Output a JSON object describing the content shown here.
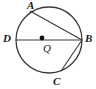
{
  "figure": {
    "type": "circle-with-inscribed-chords",
    "stroke_color": "#3a3a3a",
    "background_color": "#ffffff",
    "label_color": "#1a1a1a"
  },
  "circle": {
    "center_x": 49,
    "center_y": 40,
    "radius": 33,
    "stroke_width": 1.3
  },
  "center_point": {
    "label": "Q",
    "x": 42,
    "y": 38,
    "dot_radius": 2.4
  },
  "points": [
    {
      "name": "A",
      "label": "A",
      "x": 30,
      "y": 11,
      "label_x": 27,
      "label_y": 0
    },
    {
      "name": "B",
      "label": "B",
      "x": 82,
      "y": 40,
      "label_x": 85,
      "label_y": 33
    },
    {
      "name": "C",
      "label": "C",
      "x": 61,
      "y": 71,
      "label_x": 53,
      "label_y": 76
    },
    {
      "name": "D",
      "label": "D",
      "x": 16,
      "y": 40,
      "label_x": 3,
      "label_y": 33
    }
  ],
  "segments": [
    {
      "name": "diameter-DB",
      "from": "D",
      "to": "B",
      "x1": 16,
      "y1": 40,
      "x2": 82,
      "y2": 40
    },
    {
      "name": "chord-AB",
      "from": "A",
      "to": "B",
      "x1": 30,
      "y1": 11,
      "x2": 82,
      "y2": 40
    },
    {
      "name": "chord-CB",
      "from": "C",
      "to": "B",
      "x1": 61,
      "y1": 71,
      "x2": 82,
      "y2": 40
    }
  ]
}
